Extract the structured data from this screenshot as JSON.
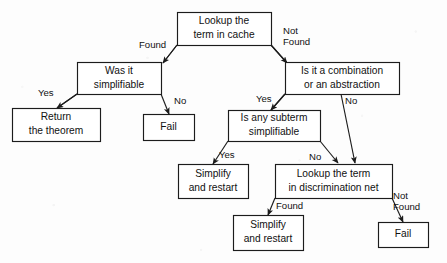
{
  "diagram": {
    "type": "flowchart",
    "canvas": {
      "width": 447,
      "height": 263
    },
    "colors": {
      "background": "#fdfdfd",
      "box_fill": "#ffffff",
      "stroke": "#1c1c1c",
      "text": "#111111"
    },
    "nodes": [
      {
        "id": "lookup-cache",
        "name": "lookup-term-in-cache",
        "kind": "decision",
        "lines": [
          "Lookup the",
          "term in cache"
        ],
        "x": 177,
        "y": 12,
        "w": 94,
        "h": 33
      },
      {
        "id": "was-simplifiable",
        "name": "was-it-simplifiable",
        "kind": "decision",
        "lines": [
          "Was it",
          "simplifiable"
        ],
        "x": 77,
        "y": 62,
        "w": 84,
        "h": 32
      },
      {
        "id": "is-combination",
        "name": "is-it-a-combination-or-abstraction",
        "kind": "decision",
        "lines": [
          "Is it a combination",
          "or an abstraction"
        ],
        "x": 285,
        "y": 62,
        "w": 114,
        "h": 32
      },
      {
        "id": "return-theorem",
        "name": "return-the-theorem",
        "kind": "terminal",
        "lines": [
          "Return",
          "the theorem"
        ],
        "x": 12,
        "y": 108,
        "w": 88,
        "h": 33
      },
      {
        "id": "fail-left",
        "name": "fail-left",
        "kind": "terminal",
        "lines": [
          "Fail"
        ],
        "x": 143,
        "y": 114,
        "w": 51,
        "h": 26
      },
      {
        "id": "is-subterm",
        "name": "is-any-subterm-simplifiable",
        "kind": "decision",
        "lines": [
          "Is any subterm",
          "simplifiable"
        ],
        "x": 228,
        "y": 110,
        "w": 92,
        "h": 31
      },
      {
        "id": "simplify-restart-mid",
        "name": "simplify-and-restart-middle",
        "kind": "terminal",
        "lines": [
          "Simplify",
          "and restart"
        ],
        "x": 178,
        "y": 164,
        "w": 70,
        "h": 34
      },
      {
        "id": "lookup-disc-net",
        "name": "lookup-term-in-discrimination-net",
        "kind": "decision",
        "lines": [
          "Lookup the term",
          "in discrimination net"
        ],
        "x": 275,
        "y": 164,
        "w": 117,
        "h": 34
      },
      {
        "id": "simplify-restart-bottom",
        "name": "simplify-and-restart-bottom",
        "kind": "terminal",
        "lines": [
          "Simplify",
          "and restart"
        ],
        "x": 233,
        "y": 215,
        "w": 70,
        "h": 35
      },
      {
        "id": "fail-right",
        "name": "fail-right",
        "kind": "terminal",
        "lines": [
          "Fail"
        ],
        "x": 378,
        "y": 222,
        "w": 50,
        "h": 25
      }
    ],
    "edges": [
      {
        "id": "e-cache-found",
        "name": "edge-cache-found",
        "from": "lookup-cache",
        "to": "was-simplifiable",
        "label": "Found",
        "label_lines": [
          "Found"
        ],
        "label_x": 139,
        "label_y": 45,
        "points": "177,45 163,45 134,45 163,45"
      },
      {
        "id": "e-cache-notfound",
        "name": "edge-cache-not-found",
        "from": "lookup-cache",
        "to": "is-combination",
        "label": "Not Found",
        "label_lines": [
          "Not",
          "Found"
        ],
        "label_x": 283,
        "label_y": 31,
        "points": ""
      },
      {
        "id": "e-simpl-yes",
        "name": "edge-was-simplifiable-yes",
        "from": "was-simplifiable",
        "to": "return-theorem",
        "label": "Yes",
        "label_lines": [
          "Yes"
        ],
        "label_x": 38,
        "label_y": 93,
        "points": ""
      },
      {
        "id": "e-simpl-no",
        "name": "edge-was-simplifiable-no",
        "from": "was-simplifiable",
        "to": "fail-left",
        "label": "No",
        "label_lines": [
          "No"
        ],
        "label_x": 174,
        "label_y": 101,
        "points": ""
      },
      {
        "id": "e-comb-yes",
        "name": "edge-is-combination-yes",
        "from": "is-combination",
        "to": "is-subterm",
        "label": "Yes",
        "label_lines": [
          "Yes"
        ],
        "label_x": 256,
        "label_y": 99,
        "points": ""
      },
      {
        "id": "e-comb-no",
        "name": "edge-is-combination-no",
        "from": "is-combination",
        "to": "lookup-disc-net",
        "label": "No",
        "label_lines": [
          "No"
        ],
        "label_x": 345,
        "label_y": 101,
        "points": ""
      },
      {
        "id": "e-subterm-yes",
        "name": "edge-is-subterm-yes",
        "from": "is-subterm",
        "to": "simplify-restart-mid",
        "label": "Yes",
        "label_lines": [
          "Yes"
        ],
        "label_x": 219,
        "label_y": 155,
        "points": ""
      },
      {
        "id": "e-subterm-no",
        "name": "edge-is-subterm-no",
        "from": "is-subterm",
        "to": "lookup-disc-net",
        "label": "No",
        "label_lines": [
          "No"
        ],
        "label_x": 309,
        "label_y": 157,
        "points": ""
      },
      {
        "id": "e-disc-found",
        "name": "edge-discrimination-net-found",
        "from": "lookup-disc-net",
        "to": "simplify-restart-bottom",
        "label": "Found",
        "label_lines": [
          "Found"
        ],
        "label_x": 276,
        "label_y": 206,
        "points": ""
      },
      {
        "id": "e-disc-notfound",
        "name": "edge-discrimination-net-not-found",
        "from": "lookup-disc-net",
        "to": "fail-right",
        "label": "Not Found",
        "label_lines": [
          "Not",
          "Found"
        ],
        "label_x": 393,
        "label_y": 196,
        "points": ""
      }
    ]
  }
}
